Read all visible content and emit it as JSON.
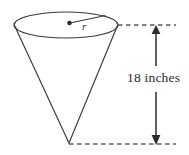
{
  "figure": {
    "shape": "cone",
    "stroke_color": "#3a3a3a",
    "dash_color": "#5a5a5a",
    "text_color": "#2b2b2b",
    "background": "#ffffff",
    "labels": {
      "radius": "r",
      "height": "18 inches"
    },
    "geometry": {
      "ellipse_center_x": 66,
      "ellipse_center_y": 25,
      "ellipse_rx": 52,
      "ellipse_ry": 13,
      "apex_x": 69,
      "apex_y": 143,
      "dimension_line_x": 156,
      "top_guide_y": 25,
      "bottom_guide_y": 144,
      "radius_dot_x": 70,
      "radius_dot_y": 23,
      "radius_end_x": 105,
      "radius_end_y": 16
    }
  }
}
